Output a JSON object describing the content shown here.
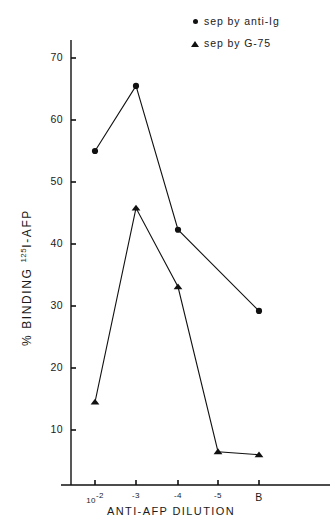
{
  "chart_data": {
    "type": "line",
    "title": "",
    "xlabel": "ANTI-AFP   DILUTION",
    "ylabel_prefix": "% BINDING ",
    "ylabel_sup": "125",
    "ylabel_suffix": "I-AFP",
    "x_categories": [
      "10-2",
      "-3",
      "-4",
      "-5",
      "B"
    ],
    "x_tick_labels": [
      {
        "base": "10",
        "sup": "-2"
      },
      {
        "base": "",
        "sup": "-3"
      },
      {
        "base": "",
        "sup": "-4"
      },
      {
        "base": "",
        "sup": "-5"
      },
      {
        "base": "B",
        "sup": ""
      }
    ],
    "y_ticks": [
      10,
      20,
      30,
      40,
      50,
      60,
      70
    ],
    "ylim": [
      0,
      75
    ],
    "grid": false,
    "legend_position": "top-right",
    "series": [
      {
        "name": "sep by anti-Ig",
        "marker": "circle",
        "color": "#111111",
        "values": [
          55.0,
          65.5,
          42.3,
          null,
          29.2
        ],
        "points": [
          {
            "x": "10-2",
            "y": 55.0
          },
          {
            "x": "-3",
            "y": 65.5
          },
          {
            "x": "-4",
            "y": 42.3
          },
          {
            "x": "B",
            "y": 29.2
          }
        ]
      },
      {
        "name": "sep by G-75",
        "marker": "triangle",
        "color": "#111111",
        "values": [
          14.5,
          45.8,
          33.1,
          6.5,
          6.0
        ],
        "points": [
          {
            "x": "10-2",
            "y": 14.5
          },
          {
            "x": "-3",
            "y": 45.8
          },
          {
            "x": "-4",
            "y": 33.1
          },
          {
            "x": "-5",
            "y": 6.5
          },
          {
            "x": "B",
            "y": 6.0
          }
        ]
      }
    ]
  },
  "legend": {
    "items": [
      {
        "label": "sep by  anti-Ig",
        "marker": "circle-marker"
      },
      {
        "label": "sep by   G-75",
        "marker": "triangle-marker"
      }
    ]
  },
  "axes": {
    "y_tick_labels": [
      "70",
      "60",
      "50",
      "40",
      "30",
      "20",
      "10"
    ],
    "x_axis_caption": "ANTI-AFP   DILUTION"
  }
}
